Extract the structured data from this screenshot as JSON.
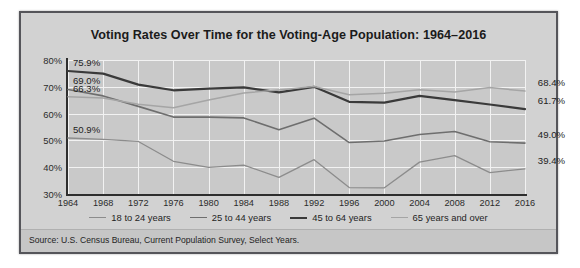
{
  "chart_data": {
    "type": "line",
    "title": "Voting Rates Over Time for the Voting-Age Population: 1964–2016",
    "xlabel": "",
    "ylabel": "",
    "x": [
      1964,
      1968,
      1972,
      1976,
      1980,
      1984,
      1988,
      1992,
      1996,
      2000,
      2004,
      2008,
      2012,
      2016
    ],
    "categories": [
      "1964",
      "1968",
      "1972",
      "1976",
      "1980",
      "1984",
      "1988",
      "1992",
      "1996",
      "2000",
      "2004",
      "2008",
      "2012",
      "2016"
    ],
    "xlim": [
      1964,
      2016
    ],
    "ylim": [
      30,
      80
    ],
    "yticks": [
      "30%",
      "40%",
      "50%",
      "60%",
      "70%",
      "80%"
    ],
    "ytick_values": [
      30,
      40,
      50,
      60,
      70,
      80
    ],
    "grid": true,
    "legend_position": "bottom",
    "series": [
      {
        "name": "18 to 24 years",
        "color": "#8c8c8c",
        "width": 1.3,
        "values": [
          50.9,
          50.4,
          49.6,
          42.2,
          39.9,
          40.8,
          36.2,
          42.8,
          32.4,
          32.3,
          41.9,
          44.3,
          38.0,
          39.4
        ],
        "start_label": "50.9%",
        "end_label": "39.4%"
      },
      {
        "name": "25 to 44 years",
        "color": "#6e6e6e",
        "width": 1.6,
        "values": [
          69.0,
          66.6,
          62.7,
          58.7,
          58.7,
          58.4,
          54.0,
          58.3,
          49.2,
          49.8,
          52.2,
          53.3,
          49.5,
          49.0
        ],
        "start_label": "69.0%",
        "end_label": "49.0%"
      },
      {
        "name": "45 to 64 years",
        "color": "#3a3a3a",
        "width": 2.2,
        "values": [
          75.9,
          74.9,
          70.8,
          68.7,
          69.3,
          69.8,
          67.9,
          70.0,
          64.4,
          64.1,
          66.6,
          65.0,
          63.4,
          61.7
        ],
        "start_label": "75.9%",
        "end_label": "61.7%"
      },
      {
        "name": "65 years and over",
        "color": "#a5a5a5",
        "width": 1.5,
        "values": [
          66.3,
          65.8,
          63.5,
          62.2,
          65.1,
          67.7,
          68.8,
          70.1,
          67.0,
          67.6,
          68.9,
          68.1,
          69.7,
          68.4
        ],
        "start_label": "66.3%",
        "end_label": "68.4%"
      }
    ],
    "source": "Source: U.S. Census Bureau, Current Population Survey, Select Years."
  }
}
